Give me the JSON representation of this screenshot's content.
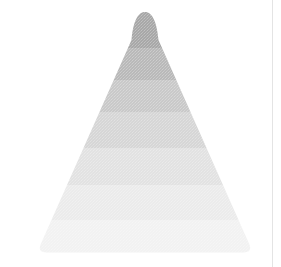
{
  "figure": {
    "title": "Pyramid",
    "type": "pyramid-diagram",
    "background_color": "#ffffff",
    "texture": "halftone-dither",
    "apex_rounding": "rounded-dome",
    "corner_rounding": "rounded",
    "accent_color": "#a8a8a8"
  },
  "divider": {
    "name": "panel-divider",
    "color": "#e4e4e4",
    "x": 272,
    "orientation": "vertical"
  },
  "chart_data": {
    "type": "pyramid",
    "title": "Pyramid",
    "subtitle": "",
    "xlabel": "",
    "ylabel": "",
    "legend_position": "none",
    "grid": false,
    "orientation": "apex-up",
    "apex": {
      "x": 145,
      "y": 12
    },
    "base": {
      "left_x": 33,
      "right_x": 257,
      "y": 255
    },
    "levels": [
      {
        "index": 1,
        "label": "",
        "color": "#a8a8a8",
        "y_top": 12,
        "y_bottom": 48,
        "value": 36
      },
      {
        "index": 2,
        "label": "",
        "color": "#b9b9b9",
        "y_top": 48,
        "y_bottom": 80,
        "value": 32
      },
      {
        "index": 3,
        "label": "",
        "color": "#c9c9c9",
        "y_top": 80,
        "y_bottom": 112,
        "value": 32
      },
      {
        "index": 4,
        "label": "",
        "color": "#d6d6d6",
        "y_top": 112,
        "y_bottom": 148,
        "value": 36
      },
      {
        "index": 5,
        "label": "",
        "color": "#e2e2e2",
        "y_top": 148,
        "y_bottom": 185,
        "value": 37
      },
      {
        "index": 6,
        "label": "",
        "color": "#ebebeb",
        "y_top": 185,
        "y_bottom": 220,
        "value": 35
      },
      {
        "index": 7,
        "label": "",
        "color": "#f2f2f2",
        "y_top": 220,
        "y_bottom": 255,
        "value": 35
      }
    ],
    "categories": [
      "1",
      "2",
      "3",
      "4",
      "5",
      "6",
      "7"
    ],
    "values": [
      36,
      32,
      32,
      36,
      37,
      35,
      35
    ],
    "ylim": [
      12,
      255
    ]
  }
}
